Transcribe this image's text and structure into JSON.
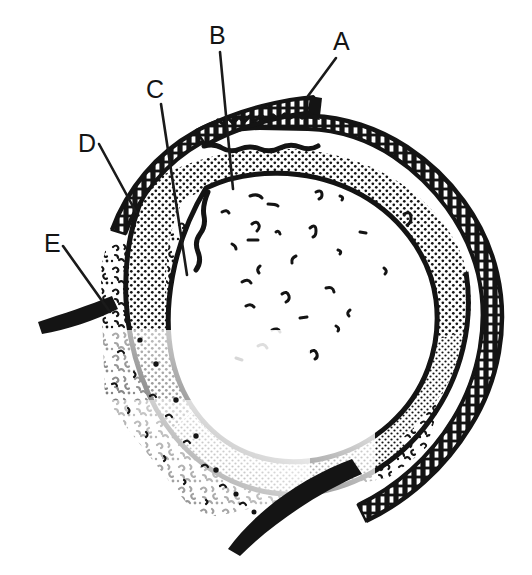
{
  "figure": {
    "kind": "line-drawing",
    "background_color": "#ffffff",
    "ink_color": "#141414",
    "width": 532,
    "height": 575,
    "labels": [
      {
        "id": "A",
        "text": "A",
        "text_x": 333,
        "text_y": 50,
        "leader": "M 336 58 L 308 96"
      },
      {
        "id": "B",
        "text": "B",
        "text_x": 209,
        "text_y": 44,
        "leader": "M 220 52 L 233 189"
      },
      {
        "id": "C",
        "text": "C",
        "text_x": 146,
        "text_y": 98,
        "leader": "M 161 104 L 187 275"
      },
      {
        "id": "D",
        "text": "D",
        "text_x": 78,
        "text_y": 152,
        "leader": "M 99 144 L 136 212"
      },
      {
        "id": "E",
        "text": "E",
        "text_x": 44,
        "text_y": 252,
        "leader": "M 63 246 L 110 312"
      }
    ],
    "regions": [
      {
        "name": "outer-hatched-rim",
        "description": "ladder-hatched thick outer capsule band"
      },
      {
        "name": "stippled-band",
        "description": "dotted / stippled middle layer"
      },
      {
        "name": "inner-lumen",
        "description": "white inner area with sparse curved marks"
      },
      {
        "name": "speckled-mass",
        "description": "dense curly speckle texture in lower-left"
      },
      {
        "name": "detached-flap",
        "description": "separated hatched segment at top pointed to by A"
      },
      {
        "name": "upper-tail",
        "description": "thick tapering stroke exiting to the left"
      },
      {
        "name": "lower-tail",
        "description": "thick tapering stroke along the bottom"
      }
    ]
  }
}
